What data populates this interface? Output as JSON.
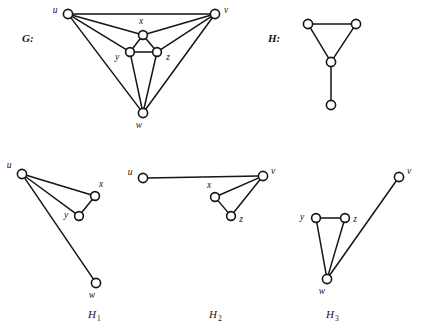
{
  "figure": {
    "background": "#ffffff",
    "ink_color": "#151515",
    "panels": [
      {
        "id": "G",
        "label": "G:",
        "label_pos": [
          22,
          42
        ],
        "vertices": [
          {
            "name": "u",
            "x": 68,
            "y": 14,
            "r": 4.6,
            "label": "u",
            "label_x": 55,
            "label_y": 13
          },
          {
            "name": "v",
            "x": 215,
            "y": 14,
            "r": 4.6,
            "label": "v",
            "label_x": 226,
            "label_y": 13
          },
          {
            "name": "x",
            "x": 143,
            "y": 35,
            "r": 4.4,
            "label": "x",
            "label_x": 141,
            "label_y": 24
          },
          {
            "name": "y",
            "x": 130,
            "y": 52,
            "r": 4.4,
            "label": "y",
            "label_x": 117,
            "label_y": 60
          },
          {
            "name": "z",
            "x": 157,
            "y": 52,
            "r": 4.4,
            "label": "z",
            "label_x": 168,
            "label_y": 60
          },
          {
            "name": "w",
            "x": 143,
            "y": 113,
            "r": 4.6,
            "label": "w",
            "label_x": 139,
            "label_y": 128
          }
        ],
        "edges": [
          [
            "u",
            "v"
          ],
          [
            "u",
            "x"
          ],
          [
            "u",
            "y"
          ],
          [
            "u",
            "w"
          ],
          [
            "v",
            "x"
          ],
          [
            "v",
            "z"
          ],
          [
            "v",
            "w"
          ],
          [
            "x",
            "y"
          ],
          [
            "x",
            "z"
          ],
          [
            "y",
            "z"
          ],
          [
            "y",
            "w"
          ],
          [
            "z",
            "w"
          ]
        ]
      },
      {
        "id": "H",
        "label": "H:",
        "label_pos": [
          268,
          42
        ],
        "vertices": [
          {
            "name": "a",
            "x": 308,
            "y": 24,
            "r": 4.6,
            "label": "",
            "label_x": 0,
            "label_y": 0
          },
          {
            "name": "b",
            "x": 356,
            "y": 24,
            "r": 4.6,
            "label": "",
            "label_x": 0,
            "label_y": 0
          },
          {
            "name": "c",
            "x": 331,
            "y": 62,
            "r": 4.6,
            "label": "",
            "label_x": 0,
            "label_y": 0
          },
          {
            "name": "d",
            "x": 331,
            "y": 105,
            "r": 4.6,
            "label": "",
            "label_x": 0,
            "label_y": 0
          }
        ],
        "edges": [
          [
            "a",
            "b"
          ],
          [
            "a",
            "c"
          ],
          [
            "b",
            "c"
          ],
          [
            "c",
            "d"
          ]
        ]
      },
      {
        "id": "H1",
        "label": "",
        "label_pos": [
          0,
          0
        ],
        "caption": "H",
        "caption_sub": "1",
        "caption_pos": [
          92,
          318
        ],
        "vertices": [
          {
            "name": "u",
            "x": 22,
            "y": 174,
            "r": 4.6,
            "label": "u",
            "label_x": 9,
            "label_y": 168
          },
          {
            "name": "x",
            "x": 95,
            "y": 196,
            "r": 4.4,
            "label": "x",
            "label_x": 101,
            "label_y": 187
          },
          {
            "name": "y",
            "x": 79,
            "y": 216,
            "r": 4.4,
            "label": "y",
            "label_x": 66,
            "label_y": 218
          },
          {
            "name": "w",
            "x": 96,
            "y": 283,
            "r": 4.6,
            "label": "w",
            "label_x": 92,
            "label_y": 298
          }
        ],
        "edges": [
          [
            "u",
            "x"
          ],
          [
            "u",
            "y"
          ],
          [
            "u",
            "w"
          ],
          [
            "x",
            "y"
          ]
        ]
      },
      {
        "id": "H2",
        "label": "",
        "label_pos": [
          0,
          0
        ],
        "caption": "H",
        "caption_sub": "2",
        "caption_pos": [
          213,
          318
        ],
        "vertices": [
          {
            "name": "u",
            "x": 143,
            "y": 178,
            "r": 4.6,
            "label": "u",
            "label_x": 130,
            "label_y": 175
          },
          {
            "name": "v",
            "x": 263,
            "y": 176,
            "r": 4.6,
            "label": "v",
            "label_x": 273,
            "label_y": 174
          },
          {
            "name": "x",
            "x": 215,
            "y": 197,
            "r": 4.4,
            "label": "x",
            "label_x": 209,
            "label_y": 188
          },
          {
            "name": "z",
            "x": 231,
            "y": 216,
            "r": 4.4,
            "label": "z",
            "label_x": 241,
            "label_y": 222
          }
        ],
        "edges": [
          [
            "u",
            "v"
          ],
          [
            "v",
            "x"
          ],
          [
            "v",
            "z"
          ],
          [
            "x",
            "z"
          ]
        ]
      },
      {
        "id": "H3",
        "label": "",
        "label_pos": [
          0,
          0
        ],
        "caption": "H",
        "caption_sub": "3",
        "caption_pos": [
          330,
          318
        ],
        "vertices": [
          {
            "name": "v",
            "x": 399,
            "y": 177,
            "r": 4.6,
            "label": "v",
            "label_x": 409,
            "label_y": 174
          },
          {
            "name": "y",
            "x": 316,
            "y": 218,
            "r": 4.4,
            "label": "y",
            "label_x": 302,
            "label_y": 220
          },
          {
            "name": "z",
            "x": 345,
            "y": 218,
            "r": 4.4,
            "label": "z",
            "label_x": 355,
            "label_y": 222
          },
          {
            "name": "w",
            "x": 327,
            "y": 279,
            "r": 4.6,
            "label": "w",
            "label_x": 322,
            "label_y": 294
          }
        ],
        "edges": [
          [
            "y",
            "z"
          ],
          [
            "y",
            "w"
          ],
          [
            "z",
            "w"
          ],
          [
            "w",
            "v"
          ]
        ]
      }
    ]
  }
}
